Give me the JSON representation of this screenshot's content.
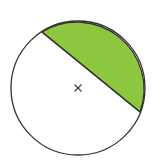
{
  "diagram": {
    "type": "circle-segment",
    "circle": {
      "cx": 78,
      "cy": 88,
      "r": 67,
      "stroke": "#333333",
      "fill": "#ffffff"
    },
    "chord": {
      "x1": 42,
      "y1": 32,
      "x2": 140,
      "y2": 112,
      "stroke": "#333333"
    },
    "shaded_segment": {
      "fill": "#8dc63f",
      "label": "shaded segment"
    },
    "center_marker": {
      "symbol": "×",
      "x": 78,
      "y": 88,
      "color": "#444444"
    }
  }
}
